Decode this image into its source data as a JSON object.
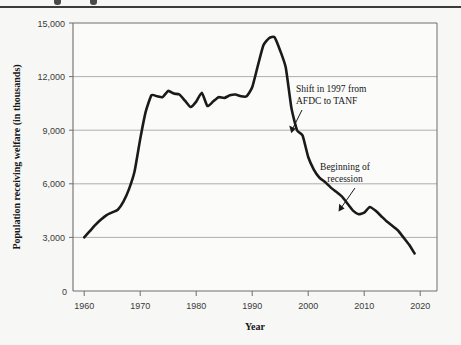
{
  "figure": {
    "background_color": "#f7f7f5",
    "top_rule_color": "#3b3b3b",
    "line_color": "#1a1a1a",
    "grid_color": "#9a9a9a",
    "axis_color": "#6e6e6e",
    "text_color": "#1a1a1a"
  },
  "chart_data": {
    "type": "line",
    "title": "",
    "subtitle": "",
    "xlabel": "Year",
    "ylabel": "Population receiving welfare (in thousands)",
    "xlim": [
      1958,
      2023
    ],
    "ylim": [
      0,
      15000
    ],
    "xticks": [
      1960,
      1970,
      1980,
      1990,
      2000,
      2010,
      2020
    ],
    "xtick_labels": [
      "1960",
      "1970",
      "1980",
      "1990",
      "2000",
      "2010",
      "2020"
    ],
    "yticks": [
      0,
      3000,
      6000,
      9000,
      12000,
      15000
    ],
    "ytick_labels": [
      "0",
      "3,000",
      "6,000",
      "9,000",
      "12,000",
      "15,000"
    ],
    "origin_label": "0",
    "grid": "horizontal",
    "legend": "none",
    "series": [
      {
        "name": "Population receiving welfare",
        "x": [
          1960,
          1961,
          1962,
          1963,
          1964,
          1965,
          1966,
          1967,
          1968,
          1969,
          1970,
          1971,
          1972,
          1973,
          1974,
          1975,
          1976,
          1977,
          1978,
          1979,
          1980,
          1981,
          1982,
          1983,
          1984,
          1985,
          1986,
          1987,
          1988,
          1989,
          1990,
          1991,
          1992,
          1993,
          1994,
          1995,
          1996,
          1997,
          1998,
          1999,
          2000,
          2001,
          2002,
          2003,
          2004,
          2005,
          2006,
          2007,
          2008,
          2009,
          2010,
          2011,
          2012,
          2013,
          2014,
          2015,
          2016,
          2017,
          2018,
          2019
        ],
        "values": [
          3005,
          3350,
          3700,
          4000,
          4250,
          4400,
          4550,
          5000,
          5700,
          6700,
          8500,
          10050,
          10950,
          10900,
          10850,
          11200,
          11050,
          11000,
          10650,
          10300,
          10600,
          11100,
          10350,
          10600,
          10850,
          10800,
          10950,
          11000,
          10900,
          10900,
          11400,
          12600,
          13750,
          14150,
          14200,
          13450,
          12500,
          10250,
          9000,
          8700,
          7500,
          6800,
          6350,
          6100,
          5800,
          5550,
          5300,
          4900,
          4500,
          4300,
          4390,
          4700,
          4500,
          4200,
          3900,
          3650,
          3400,
          3000,
          2600,
          2100
        ]
      }
    ],
    "annotations": [
      {
        "id": "annotation-afdc-tanf",
        "lines": [
          "Shift in 1997 from",
          "AFDC to TANF"
        ],
        "text_x": 1994.5,
        "text_y": 11000,
        "point_x": 1997.4,
        "point_y": 9400
      },
      {
        "id": "annotation-recession",
        "lines": [
          "Beginning of",
          "recession"
        ],
        "text_x": 2003.5,
        "text_y": 7300,
        "point_x": 2008.4,
        "point_y": 4650
      }
    ]
  }
}
